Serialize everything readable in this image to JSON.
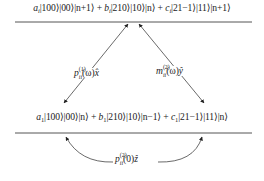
{
  "diagram": {
    "top_level": {
      "terms": [
        {
          "coef": "a",
          "sub": "i",
          "ket": "|100⟩|00⟩|n+1⟩",
          "join": " + "
        },
        {
          "coef": "b",
          "sub": "i",
          "ket": "|210⟩|10⟩|n⟩",
          "join": " + "
        },
        {
          "coef": "c",
          "sub": "i",
          "ket": "|21−1⟩|11⟩|n+1⟩",
          "join": ""
        }
      ]
    },
    "bottom_level": {
      "terms": [
        {
          "coef": "a",
          "sub": "1",
          "ket": "|100⟩|00⟩|n⟩",
          "join": " + "
        },
        {
          "coef": "b",
          "sub": "1",
          "ket": "|210⟩|10⟩|n−1⟩",
          "join": " + "
        },
        {
          "coef": "c",
          "sub": "1",
          "ket": "|21−1⟩|11⟩|n⟩",
          "join": ""
        }
      ]
    },
    "transitions": [
      {
        "name": "p-transition-x",
        "symbol": "p",
        "superscript": "(1)",
        "subscript": "ii",
        "arg": "(ω)",
        "axis": "x̂"
      },
      {
        "name": "m-transition-y",
        "symbol": "m",
        "superscript": "(2)",
        "subscript": "ii",
        "arg": "(ω)",
        "axis": "ŷ"
      },
      {
        "name": "p-transition-z",
        "symbol": "p",
        "superscript": "(2)",
        "subscript": "ii",
        "arg": "(0)",
        "axis": "ẑ"
      }
    ],
    "colors": {
      "line": "#555555",
      "text": "#222222",
      "arrow": "#333333"
    }
  }
}
